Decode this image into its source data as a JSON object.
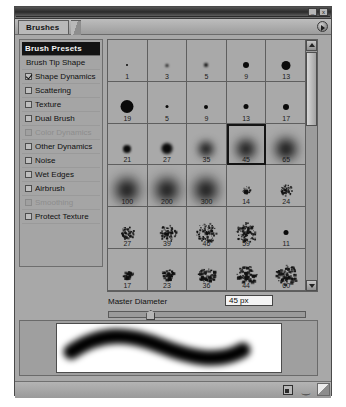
{
  "window": {
    "tab_label": "Brushes",
    "minimize_label": "_",
    "close_label": "x"
  },
  "options": {
    "header_label": "Brush Presets",
    "items": [
      {
        "label": "Brush Tip Shape",
        "type": "plain",
        "checked": false,
        "disabled": false
      },
      {
        "label": "Shape Dynamics",
        "type": "checkbox",
        "checked": true,
        "disabled": false
      },
      {
        "label": "Scattering",
        "type": "checkbox",
        "checked": false,
        "disabled": false
      },
      {
        "label": "Texture",
        "type": "checkbox",
        "checked": false,
        "disabled": false
      },
      {
        "label": "Dual Brush",
        "type": "checkbox",
        "checked": false,
        "disabled": false
      },
      {
        "label": "Color Dynamics",
        "type": "checkbox",
        "checked": false,
        "disabled": true
      },
      {
        "label": "Other Dynamics",
        "type": "checkbox",
        "checked": false,
        "disabled": false
      },
      {
        "label": "Noise",
        "type": "checkbox",
        "checked": false,
        "disabled": false
      },
      {
        "label": "Wet Edges",
        "type": "checkbox",
        "checked": false,
        "disabled": false
      },
      {
        "label": "Airbrush",
        "type": "checkbox",
        "checked": false,
        "disabled": false
      },
      {
        "label": "Smoothing",
        "type": "checkbox",
        "checked": false,
        "disabled": true
      },
      {
        "label": "Protect Texture",
        "type": "checkbox",
        "checked": false,
        "disabled": false
      }
    ]
  },
  "brush_grid": {
    "selected_label": "45",
    "cells": [
      {
        "label": "1",
        "size": 2,
        "hardness": "hard",
        "style": "round"
      },
      {
        "label": "3",
        "size": 3,
        "hardness": "soft",
        "style": "round"
      },
      {
        "label": "5",
        "size": 4,
        "hardness": "soft",
        "style": "round"
      },
      {
        "label": "9",
        "size": 6,
        "hardness": "hard",
        "style": "round"
      },
      {
        "label": "13",
        "size": 9,
        "hardness": "hard",
        "style": "round"
      },
      {
        "label": "19",
        "size": 13,
        "hardness": "hard",
        "style": "round"
      },
      {
        "label": "5",
        "size": 3,
        "hardness": "hard",
        "style": "round"
      },
      {
        "label": "9",
        "size": 4,
        "hardness": "hard",
        "style": "round"
      },
      {
        "label": "13",
        "size": 5,
        "hardness": "hard",
        "style": "round"
      },
      {
        "label": "17",
        "size": 6,
        "hardness": "hard",
        "style": "round"
      },
      {
        "label": "21",
        "size": 8,
        "hardness": "medium",
        "style": "round"
      },
      {
        "label": "27",
        "size": 11,
        "hardness": "medium",
        "style": "round"
      },
      {
        "label": "35",
        "size": 14,
        "hardness": "soft",
        "style": "round"
      },
      {
        "label": "45",
        "size": 18,
        "hardness": "soft",
        "style": "round"
      },
      {
        "label": "65",
        "size": 20,
        "hardness": "soft",
        "style": "round"
      },
      {
        "label": "100",
        "size": 22,
        "hardness": "soft",
        "style": "round"
      },
      {
        "label": "200",
        "size": 22,
        "hardness": "soft",
        "style": "round"
      },
      {
        "label": "300",
        "size": 22,
        "hardness": "soft",
        "style": "round"
      },
      {
        "label": "14",
        "size": 8,
        "hardness": "hard",
        "style": "spatter"
      },
      {
        "label": "24",
        "size": 12,
        "hardness": "hard",
        "style": "spatter"
      },
      {
        "label": "27",
        "size": 13,
        "hardness": "hard",
        "style": "spatter"
      },
      {
        "label": "39",
        "size": 17,
        "hardness": "hard",
        "style": "spatter"
      },
      {
        "label": "46",
        "size": 20,
        "hardness": "hard",
        "style": "spatter"
      },
      {
        "label": "59",
        "size": 21,
        "hardness": "hard",
        "style": "spatter"
      },
      {
        "label": "11",
        "size": 5,
        "hardness": "hard",
        "style": "round"
      },
      {
        "label": "17",
        "size": 9,
        "hardness": "hard",
        "style": "chalk"
      },
      {
        "label": "23",
        "size": 12,
        "hardness": "hard",
        "style": "chalk"
      },
      {
        "label": "36",
        "size": 17,
        "hardness": "hard",
        "style": "chalk"
      },
      {
        "label": "44",
        "size": 20,
        "hardness": "hard",
        "style": "chalk"
      },
      {
        "label": "60",
        "size": 23,
        "hardness": "hard",
        "style": "chalk"
      }
    ]
  },
  "master_diameter": {
    "label": "Master Diameter",
    "value": "45 px",
    "slider_percent": 19
  },
  "status_bar": {
    "new_brush_icon": "new-brush-icon",
    "delete_brush_icon": "trash-icon"
  },
  "colors": {
    "panel_bg": "#a8a8a8",
    "header_bg": "#131313",
    "selection_outline": "#151515",
    "stroke_color": "#000000"
  }
}
